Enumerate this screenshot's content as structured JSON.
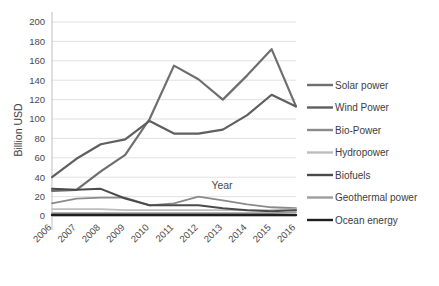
{
  "chart_data": {
    "type": "line",
    "title": "",
    "xlabel": "Year",
    "ylabel": "Billion USD",
    "x": [
      2006,
      2007,
      2008,
      2009,
      2010,
      2011,
      2012,
      2013,
      2014,
      2015,
      2016
    ],
    "categories": [
      "2006",
      "2007",
      "2008",
      "2009",
      "2010",
      "2011",
      "2012",
      "2013",
      "2014",
      "2015",
      "2016"
    ],
    "xlim": [
      2006,
      2016
    ],
    "ylim": [
      0,
      200
    ],
    "yticks": [
      0,
      20,
      40,
      60,
      80,
      100,
      120,
      140,
      160,
      180,
      200
    ],
    "ytick_labels": [
      "0",
      "20",
      "40",
      "60",
      "80",
      "100",
      "120",
      "140",
      "160",
      "180",
      "200"
    ],
    "grid": "horizontal",
    "legend_position": "right",
    "series": [
      {
        "name": "Solar power",
        "color": "#6e6e6e",
        "width": 2.2,
        "values": [
          26,
          27,
          46,
          63,
          100,
          155,
          141,
          120,
          145,
          172,
          113
        ]
      },
      {
        "name": "Wind Power",
        "color": "#5f5f5f",
        "width": 2.2,
        "values": [
          40,
          59,
          74,
          79,
          98,
          85,
          85,
          89,
          104,
          125,
          113
        ]
      },
      {
        "name": "Bio-Power",
        "color": "#8a8a8a",
        "width": 1.8,
        "values": [
          13,
          18,
          19,
          19,
          11,
          13,
          20,
          16,
          12,
          9,
          8
        ]
      },
      {
        "name": "Hydropower",
        "color": "#bdbdbd",
        "width": 1.8,
        "values": [
          7,
          7,
          7,
          6,
          6,
          6,
          6,
          6,
          6,
          6,
          7
        ]
      },
      {
        "name": "Biofuels",
        "color": "#4a4a4a",
        "width": 2.0,
        "values": [
          28,
          27,
          28,
          18,
          11,
          11,
          11,
          8,
          6,
          5,
          6
        ]
      },
      {
        "name": "Geothermal power",
        "color": "#9c9c9c",
        "width": 1.8,
        "values": [
          3,
          3,
          3,
          3,
          3,
          3,
          3,
          3,
          3,
          3,
          4
        ]
      },
      {
        "name": "Ocean energy",
        "color": "#1f1f1f",
        "width": 2.4,
        "values": [
          1,
          1,
          1,
          1,
          1,
          1,
          1,
          1,
          1,
          1,
          1
        ]
      }
    ]
  },
  "plot": {
    "inplot_label": "Year"
  }
}
